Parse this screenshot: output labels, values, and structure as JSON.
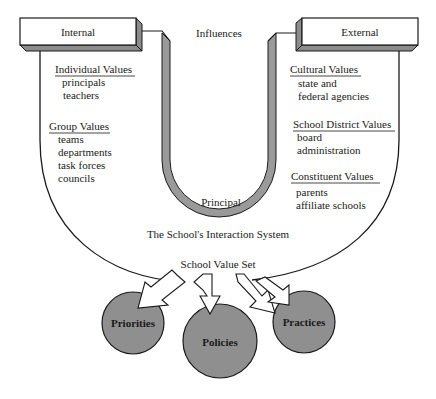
{
  "diagram": {
    "influences_label": "Influences",
    "principal_label": "Principal",
    "interaction_system_label": "The School's Interaction System",
    "value_set_label": "School Value Set",
    "colors": {
      "line": "#1a1a1a",
      "u_tube_fill": "#9a9a9a",
      "box_side": "#8c8c8c",
      "circle_fill": "#8f8f8f",
      "background": "#ffffff"
    },
    "internal": {
      "title": "Internal",
      "groups": [
        {
          "heading": "Individual Values",
          "items": [
            "principals",
            "teachers"
          ]
        },
        {
          "heading": "Group Values",
          "items": [
            "teams",
            "departments",
            "task forces",
            "councils"
          ]
        }
      ]
    },
    "external": {
      "title": "External",
      "groups": [
        {
          "heading": "Cultural Values",
          "items": [
            "state  and",
            "federal agencies"
          ]
        },
        {
          "heading": "School District Values",
          "items": [
            "board",
            "administration"
          ]
        },
        {
          "heading": "Constituent Values",
          "items": [
            "parents",
            "affiliate schools"
          ]
        }
      ]
    },
    "outputs": [
      {
        "label": "Priorities"
      },
      {
        "label": "Policies"
      },
      {
        "label": "Practices"
      }
    ]
  }
}
